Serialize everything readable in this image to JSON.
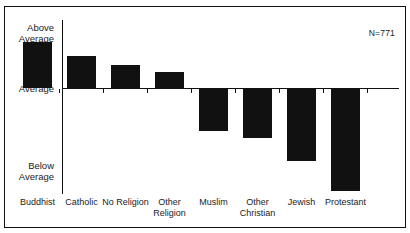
{
  "figure": {
    "title": "",
    "annotation": "N=771"
  },
  "axes": {
    "y_labels": {
      "top": "Above\nAverage",
      "middle": "Average",
      "bottom": "Below\nAverage"
    }
  },
  "chart_data": {
    "type": "bar",
    "title": "",
    "subtitle": "",
    "xlabel": "",
    "ylabel": "",
    "grid": false,
    "legend": null,
    "annotations": [
      "N=771"
    ],
    "ytick_labels": [
      "Above Average",
      "Average",
      "Below Average"
    ],
    "ytick_values": [
      1,
      0,
      -1
    ],
    "ylim": [
      -1.1,
      1.05
    ],
    "baseline": 0,
    "bar_color": "#111111",
    "categories": [
      "Buddhist",
      "Catholic",
      "No Religion",
      "Other Religion",
      "Muslim",
      "Other Christian",
      "Jewish",
      "Protestant"
    ],
    "values": [
      0.69,
      0.48,
      0.34,
      0.24,
      -0.4,
      -0.47,
      -0.69,
      -0.98
    ]
  },
  "bars": [
    {
      "label": "Buddhist",
      "value": 0.69,
      "left": 18,
      "width": 29
    },
    {
      "label": "Catholic",
      "value": 0.48,
      "left": 62,
      "width": 29
    },
    {
      "label": "No Religion",
      "value": 0.34,
      "left": 106,
      "width": 29
    },
    {
      "label": "Other\nReligion",
      "value": 0.24,
      "left": 150,
      "width": 29
    },
    {
      "label": "Muslim",
      "value": -0.4,
      "left": 194,
      "width": 29
    },
    {
      "label": "Other\nChristian",
      "value": -0.47,
      "left": 238,
      "width": 29
    },
    {
      "label": "Jewish",
      "value": -0.69,
      "left": 282,
      "width": 29
    },
    {
      "label": "Protestant",
      "value": -0.98,
      "left": 326,
      "width": 29
    }
  ]
}
